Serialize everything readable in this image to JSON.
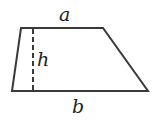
{
  "diagram": {
    "shape": "trapezoid",
    "labels": {
      "top_base": "a",
      "height": "h",
      "bottom_base": "b"
    },
    "colors": {
      "stroke": "#3a3a3a",
      "background": "#ffffff"
    }
  }
}
